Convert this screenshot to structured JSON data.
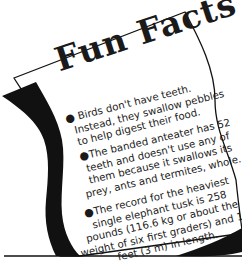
{
  "title": "Fun Facts",
  "facts": [
    {
      "bullet": "●",
      "lines": [
        "Birds don't have teeth.",
        "Instead, they swallow pebbles",
        "to help digest their food."
      ]
    },
    {
      "bullet": "●",
      "lines": [
        "The banded anteater has 52",
        "teeth and doesn't use any of",
        "them because it swallows its",
        "prey, ants and termites, whole."
      ]
    },
    {
      "bullet": "●",
      "lines": [
        "The record for the heaviest",
        "single elephant tusk is 258",
        "pounds (116.6 kg or about the",
        "weight of six first graders) and 10",
        "feet (3 m) in length."
      ]
    }
  ],
  "colors": {
    "ink": "#1a1a1a",
    "paper": "#ffffff"
  }
}
